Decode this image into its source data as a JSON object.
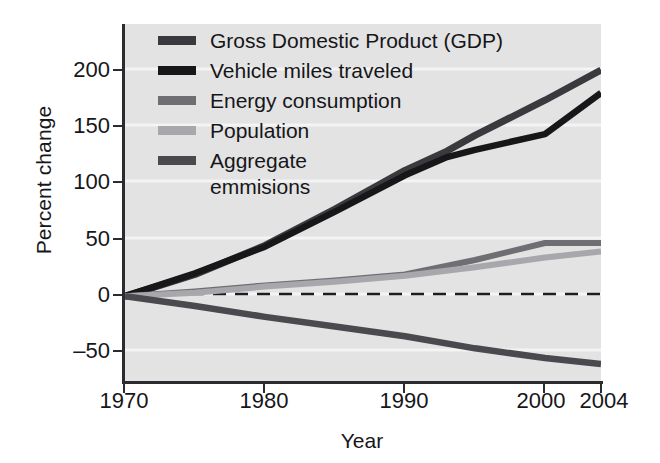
{
  "chart_data": {
    "type": "line",
    "title": "",
    "xlabel": "Year",
    "ylabel": "Percent change",
    "xlim": [
      1970,
      2004
    ],
    "ylim": [
      -70,
      225
    ],
    "xticks": [
      1970,
      1980,
      1990,
      2000,
      2004
    ],
    "xtick_labels": [
      "1970",
      "1980",
      "1990",
      "2000",
      "2004"
    ],
    "yticks": [
      200,
      150,
      100,
      50,
      0,
      -50
    ],
    "ytick_labels": [
      "200",
      "150",
      "100",
      "50",
      "0",
      "–50"
    ],
    "grid": "horizontal-white",
    "legend_position": "upper-left",
    "zero_reference_line": {
      "value": 0,
      "style": "dashed",
      "color": "#1d1d20"
    },
    "series": [
      {
        "name": "Gross Domestic Product (GDP)",
        "color": "#3a3a3e",
        "x": [
          1970,
          1975,
          1980,
          1985,
          1990,
          1993,
          1995,
          2000,
          2004
        ],
        "values": [
          0,
          18,
          42,
          72,
          104,
          120,
          133,
          162,
          187
        ]
      },
      {
        "name": "Vehicle miles traveled",
        "color": "#171719",
        "x": [
          1970,
          1975,
          1980,
          1985,
          1990,
          1993,
          1995,
          2000,
          2004
        ],
        "values": [
          0,
          19,
          41,
          70,
          100,
          115,
          121,
          134,
          168
        ]
      },
      {
        "name": "Energy consumption",
        "color": "#6f6f73",
        "x": [
          1970,
          1975,
          1980,
          1985,
          1990,
          1995,
          2000,
          2004
        ],
        "values": [
          0,
          4,
          9,
          13,
          18,
          30,
          44,
          44
        ]
      },
      {
        "name": "Population",
        "color": "#a8a8ac",
        "x": [
          1970,
          1975,
          1980,
          1985,
          1990,
          1995,
          2000,
          2004
        ],
        "values": [
          0,
          3,
          8,
          12,
          17,
          24,
          32,
          37
        ]
      },
      {
        "name": "Aggregate\nemmisions",
        "color": "#4a4a4e",
        "x": [
          1970,
          1975,
          1980,
          1985,
          1990,
          1995,
          2000,
          2004
        ],
        "values": [
          0,
          -8,
          -17,
          -25,
          -33,
          -43,
          -51,
          -56
        ]
      }
    ]
  },
  "legend": {
    "items": [
      {
        "label": "Gross Domestic Product (GDP)",
        "color": "#3a3a3e"
      },
      {
        "label": "Vehicle miles traveled",
        "color": "#171719"
      },
      {
        "label": "Energy consumption",
        "color": "#6f6f73"
      },
      {
        "label": "Population",
        "color": "#a8a8ac"
      },
      {
        "label": "Aggregate\nemmisions",
        "color": "#4a4a4e"
      }
    ]
  },
  "axes": {
    "y_title": "Percent change",
    "x_title": "Year",
    "y_ticks": [
      "200",
      "150",
      "100",
      "50",
      "0",
      "–50"
    ],
    "x_ticks": [
      "1970",
      "1980",
      "1990",
      "2000",
      "2004"
    ]
  },
  "colors": {
    "plot_background": "#e3e3e3",
    "gridline": "#f4f4f4",
    "axis": "#2c2c30",
    "text": "#16161a"
  }
}
